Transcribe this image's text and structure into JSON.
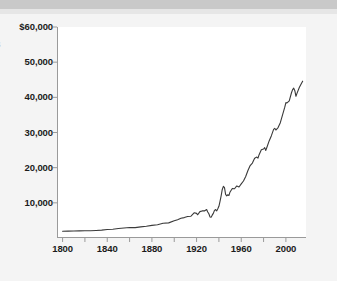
{
  "figure": {
    "background_color": "#f4f4f4",
    "plot_background_color": "#ffffff",
    "axis_color": "#9a9a9a",
    "line_color": "#3a3a3a",
    "header_band_color": "#c9c9c9",
    "axis_title_fragment": "$"
  },
  "chart_data": {
    "type": "line",
    "title": "",
    "subtitle": "",
    "xlabel": "",
    "ylabel": "",
    "xlim": [
      1795,
      2018
    ],
    "ylim": [
      0,
      60000
    ],
    "grid": false,
    "legend_position": "none",
    "x_ticks_major": [
      1800,
      1840,
      1880,
      1920,
      1960,
      2000
    ],
    "x_tick_labels": [
      "1800",
      "1840",
      "1880",
      "1920",
      "1960",
      "2000"
    ],
    "x_ticks_minor": [
      1820,
      1860,
      1900,
      1940,
      1980
    ],
    "y_ticks": [
      10000,
      20000,
      30000,
      40000,
      50000,
      60000
    ],
    "y_tick_labels": [
      "10,000",
      "20,000",
      "30,000",
      "40,000",
      "50,000",
      "$60,000"
    ],
    "series": [
      {
        "name": "value",
        "x": [
          1800,
          1805,
          1810,
          1815,
          1820,
          1825,
          1830,
          1835,
          1840,
          1845,
          1850,
          1855,
          1860,
          1865,
          1870,
          1875,
          1880,
          1885,
          1890,
          1895,
          1900,
          1903,
          1906,
          1909,
          1912,
          1915,
          1918,
          1920,
          1921,
          1923,
          1925,
          1927,
          1929,
          1930,
          1931,
          1932,
          1933,
          1934,
          1935,
          1936,
          1937,
          1938,
          1939,
          1940,
          1941,
          1942,
          1943,
          1944,
          1945,
          1946,
          1947,
          1948,
          1949,
          1950,
          1952,
          1954,
          1956,
          1958,
          1960,
          1962,
          1964,
          1966,
          1968,
          1970,
          1972,
          1974,
          1975,
          1976,
          1978,
          1980,
          1981,
          1982,
          1983,
          1985,
          1987,
          1989,
          1990,
          1991,
          1993,
          1995,
          1997,
          1999,
          2000,
          2001,
          2003,
          2005,
          2006,
          2007,
          2008,
          2009,
          2010,
          2012,
          2014,
          2015
        ],
        "values": [
          1900,
          1950,
          2000,
          2030,
          2050,
          2080,
          2150,
          2250,
          2400,
          2500,
          2700,
          2850,
          3000,
          2950,
          3150,
          3350,
          3600,
          3750,
          4200,
          4300,
          4900,
          5200,
          5600,
          5800,
          6100,
          6200,
          7200,
          7000,
          6600,
          7500,
          7700,
          7700,
          8100,
          7400,
          6900,
          6000,
          5900,
          6500,
          7000,
          7800,
          8100,
          7700,
          8300,
          9000,
          10400,
          12000,
          13800,
          14700,
          14300,
          12400,
          12000,
          12300,
          12100,
          13100,
          14100,
          14000,
          14800,
          14500,
          15400,
          16200,
          17500,
          19200,
          20600,
          21300,
          22700,
          23000,
          22700,
          23700,
          25100,
          25300,
          25700,
          24900,
          25800,
          27600,
          29100,
          30900,
          31200,
          30700,
          31400,
          32800,
          35000,
          37200,
          38500,
          38400,
          39000,
          41300,
          42200,
          42600,
          41900,
          40300,
          41200,
          42800,
          44000,
          44600
        ]
      }
    ],
    "annotations": []
  }
}
